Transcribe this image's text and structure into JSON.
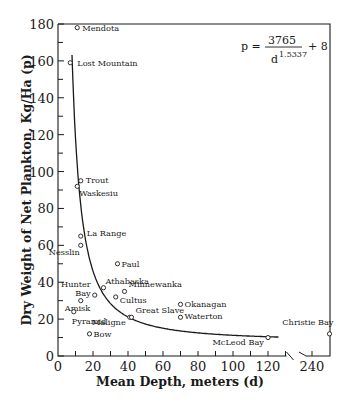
{
  "chart_data": {
    "type": "scatter",
    "title": "",
    "xlabel": "Mean Depth, meters (d)",
    "ylabel": "Dry Weight of Net Plankton, Kg/Ha (p)",
    "xlim": [
      0,
      250
    ],
    "ylim": [
      0,
      180
    ],
    "x_axis_break": {
      "from": 130,
      "to": 235
    },
    "x_ticks": [
      0,
      20,
      40,
      60,
      80,
      100,
      120,
      240
    ],
    "y_ticks": [
      0,
      20,
      40,
      60,
      80,
      100,
      120,
      140,
      160,
      180
    ],
    "grid": false,
    "annotation": {
      "formula_lhs": "p =",
      "numerator": "3765",
      "denominator_base": "d",
      "denominator_exp": "1.5337",
      "tail": "+ 8"
    },
    "fit_curve": {
      "name": "p = 3765 / d^1.5337 + 8",
      "d_range": [
        7,
        126
      ]
    },
    "points": [
      {
        "label": "Mendota",
        "d": 11,
        "p": 178
      },
      {
        "label": "Lost Mountain",
        "d": 7,
        "p": 159
      },
      {
        "label": "Trout",
        "d": 13,
        "p": 95
      },
      {
        "label": "Waskesiu",
        "d": 11,
        "p": 92
      },
      {
        "label": "La Range",
        "d": 13,
        "p": 65
      },
      {
        "label": "Nesslin",
        "d": 13,
        "p": 60
      },
      {
        "label": "Paul",
        "d": 34,
        "p": 50
      },
      {
        "label": "Athabaska",
        "d": 26,
        "p": 37
      },
      {
        "label": "Hunter Bay",
        "d": 21,
        "p": 33
      },
      {
        "label": "Amisk",
        "d": 13,
        "p": 30
      },
      {
        "label": "Pyramid",
        "d": 9,
        "p": 24
      },
      {
        "label": "Bow",
        "d": 18,
        "p": 12
      },
      {
        "label": "Cultus",
        "d": 33,
        "p": 32
      },
      {
        "label": "Minnewanka",
        "d": 38,
        "p": 35
      },
      {
        "label": "Maligne",
        "d": 41,
        "p": 21
      },
      {
        "label": "Great Slave",
        "d": 42,
        "p": 21
      },
      {
        "label": "Okanagan",
        "d": 70,
        "p": 28
      },
      {
        "label": "Waterton",
        "d": 70,
        "p": 21
      },
      {
        "label": "McLeod Bay",
        "d": 120,
        "p": 10
      },
      {
        "label": "Christie Bay",
        "d": 250,
        "p": 12
      }
    ]
  }
}
